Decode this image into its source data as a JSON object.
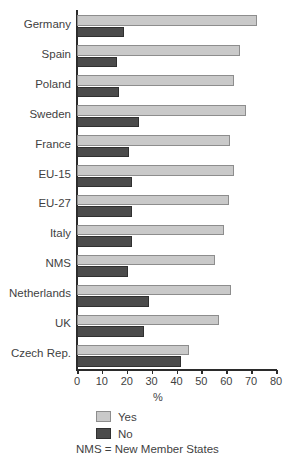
{
  "chart_data": {
    "type": "bar",
    "orientation": "horizontal",
    "title": "",
    "subtitle": "",
    "xlabel": "%",
    "ylabel": "",
    "xlim": [
      0,
      80
    ],
    "xticks": [
      0,
      10,
      20,
      30,
      40,
      50,
      60,
      70,
      80
    ],
    "xtick_labels": [
      "0",
      "10",
      "20",
      "30",
      "40",
      "50",
      "60",
      "70",
      "80"
    ],
    "grid": false,
    "legend_position": "bottom-left",
    "categories": [
      "Germany",
      "Spain",
      "Poland",
      "Sweden",
      "France",
      "EU-15",
      "EU-27",
      "Italy",
      "NMS",
      "Netherlands",
      "UK",
      "Czech Rep."
    ],
    "series": [
      {
        "name": "Yes",
        "color": "#c9c9c9",
        "values": [
          72.5,
          65.5,
          63.0,
          68.0,
          61.5,
          63.0,
          61.0,
          59.0,
          55.5,
          62.0,
          57.0,
          45.0
        ]
      },
      {
        "name": "No",
        "color": "#4b4b4b",
        "values": [
          19.0,
          16.0,
          17.0,
          25.0,
          21.0,
          22.0,
          22.0,
          22.0,
          20.5,
          29.0,
          27.0,
          42.0
        ]
      }
    ],
    "annotations": [
      "NMS = New Member States"
    ]
  },
  "legend": {
    "entries": [
      {
        "label": "Yes",
        "swatch": "light-gray"
      },
      {
        "label": "No",
        "swatch": "dark-gray"
      }
    ],
    "note": "NMS = New Member States"
  },
  "axis": {
    "x_title": "%"
  }
}
